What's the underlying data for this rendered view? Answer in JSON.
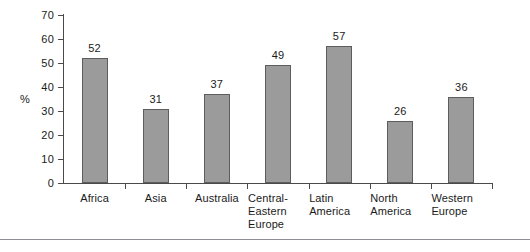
{
  "chart_data": {
    "type": "bar",
    "title": "",
    "xlabel": "",
    "ylabel": "%",
    "ylim": [
      0,
      70
    ],
    "yticks": [
      0,
      10,
      20,
      30,
      40,
      50,
      60,
      70
    ],
    "ytick_labels": [
      "0",
      "10",
      "20",
      "30",
      "40",
      "50",
      "60",
      "70"
    ],
    "grid": false,
    "legend": null,
    "bar_color": "#9b9b9b",
    "bar_edge_color": "#5d5d5d",
    "axis_color": "#4a4a4a",
    "categories": [
      "Africa",
      "Asia",
      "Australia",
      "Central-Eastern Europe",
      "Latin America",
      "North America",
      "Western Europe"
    ],
    "category_label_lines": [
      [
        "Africa"
      ],
      [
        "Asia"
      ],
      [
        "Australia"
      ],
      [
        "Central-",
        "Eastern",
        "Europe"
      ],
      [
        "Latin",
        "America"
      ],
      [
        "North",
        "America"
      ],
      [
        "Western",
        "Europe"
      ]
    ],
    "values": [
      52,
      31,
      37,
      49,
      57,
      26,
      36
    ],
    "value_labels": [
      "52",
      "31",
      "37",
      "49",
      "57",
      "26",
      "36"
    ]
  },
  "footer": {
    "rule_color": "#8f8f97"
  }
}
